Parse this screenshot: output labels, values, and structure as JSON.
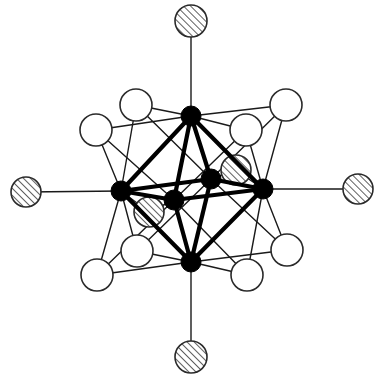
{
  "figure": {
    "title": "Octahedral M6X12 cluster with terminal ligands",
    "colors": {
      "metal": "#000000",
      "open_ligand_fill": "#ffffff",
      "outline": "#2a2a2a",
      "background": "#ffffff"
    },
    "legend": {
      "metal": "metal atom (solid)",
      "bridging": "edge-bridging ligand (open circle)",
      "terminal": "terminal / inner ligand (hatched circle)"
    }
  },
  "atoms": {
    "metals": [
      {
        "id": "M_top",
        "x": 191,
        "y": 116,
        "r": 10
      },
      {
        "id": "M_bottom",
        "x": 191,
        "y": 262,
        "r": 10
      },
      {
        "id": "M_left",
        "x": 121,
        "y": 191,
        "r": 10
      },
      {
        "id": "M_right",
        "x": 263,
        "y": 189,
        "r": 10
      },
      {
        "id": "M_front",
        "x": 174,
        "y": 200,
        "r": 10
      },
      {
        "id": "M_back",
        "x": 211,
        "y": 179,
        "r": 10
      }
    ],
    "open_ligands": [
      {
        "id": "X_ul_out",
        "x": 96,
        "y": 130,
        "r": 16
      },
      {
        "id": "X_ul_in",
        "x": 136,
        "y": 105,
        "r": 16
      },
      {
        "id": "X_ur_out",
        "x": 286,
        "y": 105,
        "r": 16
      },
      {
        "id": "X_ur_in",
        "x": 246,
        "y": 130,
        "r": 16
      },
      {
        "id": "X_ll_out",
        "x": 97,
        "y": 275,
        "r": 16
      },
      {
        "id": "X_ll_in",
        "x": 137,
        "y": 251,
        "r": 16
      },
      {
        "id": "X_lr_out",
        "x": 287,
        "y": 250,
        "r": 16
      },
      {
        "id": "X_lr_in",
        "x": 247,
        "y": 275,
        "r": 16
      }
    ],
    "hatched_ligands": [
      {
        "id": "T_top",
        "x": 191,
        "y": 21,
        "r": 16
      },
      {
        "id": "T_bottom",
        "x": 191,
        "y": 357,
        "r": 16
      },
      {
        "id": "T_left",
        "x": 26,
        "y": 192,
        "r": 15
      },
      {
        "id": "T_right",
        "x": 358,
        "y": 189,
        "r": 15
      },
      {
        "id": "X_front_bridge",
        "x": 149,
        "y": 212,
        "r": 15
      },
      {
        "id": "X_back_bridge",
        "x": 236,
        "y": 170,
        "r": 15
      }
    ]
  },
  "bonds": {
    "thick": [
      [
        "M_top",
        "M_left"
      ],
      [
        "M_top",
        "M_right"
      ],
      [
        "M_top",
        "M_front"
      ],
      [
        "M_top",
        "M_back"
      ],
      [
        "M_bottom",
        "M_left"
      ],
      [
        "M_bottom",
        "M_right"
      ],
      [
        "M_bottom",
        "M_front"
      ],
      [
        "M_bottom",
        "M_back"
      ],
      [
        "M_left",
        "M_front"
      ],
      [
        "M_front",
        "M_right"
      ],
      [
        "M_right",
        "M_back"
      ],
      [
        "M_back",
        "M_left"
      ]
    ],
    "thin": [
      [
        "T_top",
        "M_top"
      ],
      [
        "T_bottom",
        "M_bottom"
      ],
      [
        "T_left",
        "M_left"
      ],
      [
        "T_right",
        "M_right"
      ],
      [
        "X_ul_out",
        "M_top"
      ],
      [
        "X_ul_out",
        "M_left"
      ],
      [
        "X_ul_in",
        "M_top"
      ],
      [
        "X_ul_in",
        "M_left"
      ],
      [
        "X_ur_out",
        "M_top"
      ],
      [
        "X_ur_out",
        "M_right"
      ],
      [
        "X_ur_in",
        "M_top"
      ],
      [
        "X_ur_in",
        "M_right"
      ],
      [
        "X_ll_out",
        "M_left"
      ],
      [
        "X_ll_out",
        "M_bottom"
      ],
      [
        "X_ll_in",
        "M_left"
      ],
      [
        "X_ll_in",
        "M_bottom"
      ],
      [
        "X_lr_out",
        "M_right"
      ],
      [
        "X_lr_out",
        "M_bottom"
      ],
      [
        "X_lr_in",
        "M_right"
      ],
      [
        "X_lr_in",
        "M_bottom"
      ],
      [
        "X_ul_in",
        "M_back"
      ],
      [
        "X_ur_in",
        "M_front"
      ],
      [
        "X_ll_in",
        "M_back"
      ],
      [
        "X_lr_in",
        "M_front"
      ],
      [
        "X_ul_out",
        "M_front"
      ],
      [
        "X_ur_out",
        "M_back"
      ],
      [
        "X_ll_out",
        "M_front"
      ],
      [
        "X_lr_out",
        "M_back"
      ],
      [
        "X_front_bridge",
        "M_left"
      ],
      [
        "X_front_bridge",
        "M_front"
      ],
      [
        "X_back_bridge",
        "M_back"
      ],
      [
        "X_back_bridge",
        "M_right"
      ]
    ]
  }
}
